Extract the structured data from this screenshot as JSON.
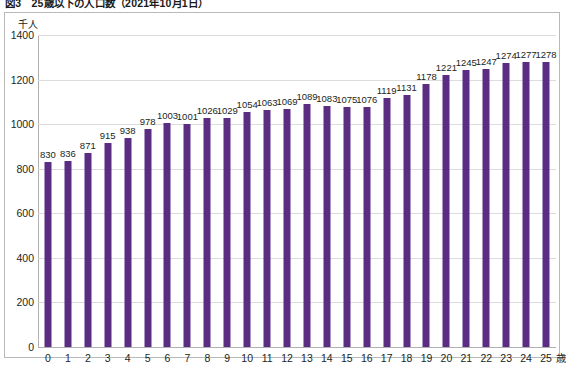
{
  "figure": {
    "caption": "図3　25歳以下の人口数（2021年10月1日）"
  },
  "chart_data": {
    "type": "bar",
    "title": "図3　25歳以下の人口数（2021年10月1日）",
    "xlabel": "歳",
    "ylabel": "千人",
    "y_unit_label": "千人",
    "x_unit_label": "歳",
    "categories": [
      "0",
      "1",
      "2",
      "3",
      "4",
      "5",
      "6",
      "7",
      "8",
      "9",
      "10",
      "11",
      "12",
      "13",
      "14",
      "15",
      "16",
      "17",
      "18",
      "19",
      "20",
      "21",
      "22",
      "23",
      "24",
      "25"
    ],
    "values": [
      830,
      836,
      871,
      915,
      938,
      978,
      1003,
      1001,
      1026,
      1029,
      1054,
      1063,
      1069,
      1089,
      1083,
      1075,
      1076,
      1119,
      1131,
      1178,
      1221,
      1245,
      1247,
      1274,
      1277,
      1278
    ],
    "ylim": [
      0,
      1400
    ],
    "y_ticks": [
      0,
      200,
      400,
      600,
      800,
      1000,
      1200,
      1400
    ],
    "grid": true,
    "legend": false,
    "bar_color": "#5B2D82",
    "gridline_color": "#dcdcdc",
    "axis_color": "#b0b0b0",
    "frame_color": "#b9b9b9"
  }
}
